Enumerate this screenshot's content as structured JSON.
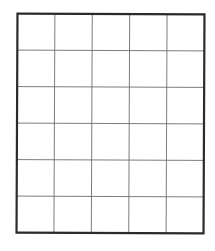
{
  "grid": {
    "rows": 6,
    "columns": 5,
    "outer_border_color": "#2b2b2b",
    "inner_line_color": "#6e6e6e",
    "background_color": "#ffffff",
    "outer_border_width": 2.2,
    "inner_line_width": 0.9
  }
}
